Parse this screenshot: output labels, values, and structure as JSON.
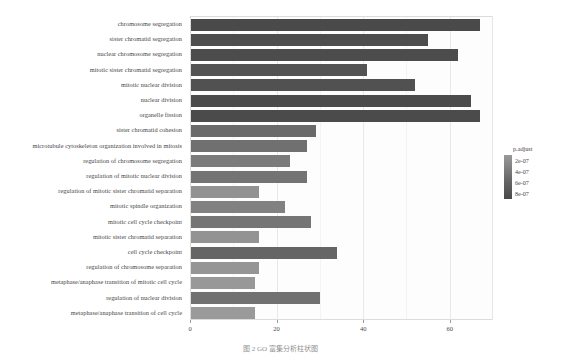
{
  "figure": {
    "caption": "图 2    GO 富集分析柱状图"
  },
  "legend": {
    "title": "p.adjust",
    "keys": [
      "2e-07",
      "4e-07",
      "6e-07",
      "8e-07"
    ],
    "low_color": "#9a9a9a",
    "high_color": "#4a4a4a"
  },
  "axis": {
    "x_ticks": [
      "0",
      "20",
      "40",
      "60"
    ],
    "x_tick_values": [
      0,
      20,
      40,
      60
    ],
    "x_label": "",
    "y_label": ""
  },
  "chart_data": {
    "type": "bar",
    "orientation": "horizontal",
    "title": "",
    "xlabel": "",
    "ylabel": "",
    "xlim": [
      0,
      70
    ],
    "grid": true,
    "legend_position": "right",
    "bar_color": "#6e6e6e",
    "categories": [
      "chromosome segregation",
      "sister chromatid segregation",
      "nuclear chromosome segregation",
      "mitotic sister chromatid segregation",
      "mitotic nuclear division",
      "nuclear division",
      "organelle fission",
      "sister chromatid cohesion",
      "microtubule cytoskeleton organization involved in mitosis",
      "regulation of chromosome segregation",
      "regulation of mitotic nuclear division",
      "regulation of mitotic sister chromatid separation",
      "mitotic spindle organization",
      "mitotic cell cycle checkpoint",
      "mitotic sister chromatid separation",
      "cell cycle checkpoint",
      "regulation of chromosome separation",
      "metaphase/anaphase transition of mitotic cell cycle",
      "regulation of nuclear division",
      "metaphase/anaphase transition of cell cycle"
    ],
    "values": [
      67,
      55,
      62,
      41,
      52,
      65,
      67,
      29,
      27,
      23,
      27,
      16,
      22,
      28,
      16,
      34,
      16,
      15,
      30,
      15
    ],
    "p_adjust": [
      1.2e-07,
      1.5e-07,
      1.4e-07,
      2e-07,
      1.8e-07,
      1.3e-07,
      1.3e-07,
      4e-07,
      4.5e-07,
      5.5e-07,
      4.8e-07,
      7.5e-07,
      6e-07,
      5e-07,
      7.6e-07,
      3.6e-07,
      7.8e-07,
      8e-07,
      4.6e-07,
      8.2e-07
    ]
  }
}
